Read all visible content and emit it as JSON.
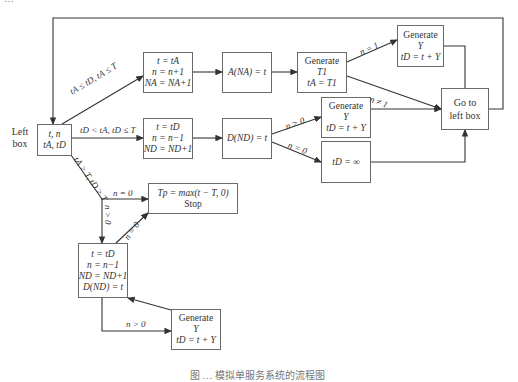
{
  "diagram": {
    "type": "flowchart",
    "left_label": [
      "Left",
      "box"
    ],
    "boxes": {
      "left_box": [
        "t, n",
        "tA, tD"
      ],
      "arrival_update": [
        "t = tA",
        "n = n+1",
        "NA = NA+1"
      ],
      "arrival_record": [
        "A(NA) = t"
      ],
      "generate_T1": [
        "Generate",
        "T1",
        "tA = T1"
      ],
      "generate_Y_top": [
        "Generate",
        "Y",
        "tD = t + Y"
      ],
      "go_to_left_box": [
        "Go to",
        "left box"
      ],
      "departure_update": [
        "t = tD",
        "n = n−1",
        "ND = ND+1"
      ],
      "departure_record": [
        "D(ND) = t"
      ],
      "generate_Y_mid": [
        "Generate",
        "Y",
        "tD = t + Y"
      ],
      "tD_infinity": [
        "tD = ∞"
      ],
      "stop": [
        "Tp = max(t − T, 0)",
        "Stop"
      ],
      "final_departure": [
        "t = tD",
        "n = n−1",
        "ND = ND+1",
        "D(ND) = t"
      ],
      "generate_Y_bottom": [
        "Generate",
        "Y",
        "tD = t + Y"
      ]
    },
    "edge_labels": {
      "to_arrival": "tA ≤ tD, tA ≤ T",
      "to_departure": "tD < tA, tD ≤ T",
      "to_end": "tA > T, tD > T",
      "n_eq_1": "n = 1",
      "n_neq_1": "n ≠ 1",
      "n_gt_0_mid": "n > 0",
      "n_eq_0_mid": "n = 0",
      "n_eq_0_stop": "n = 0",
      "n_gt_0_down": "n > 0",
      "n_eq_0_back": "n = 0",
      "n_gt_0_bottom": "n > 0"
    },
    "caption_clipped": "图 … 模拟单服务系统的流程图"
  }
}
